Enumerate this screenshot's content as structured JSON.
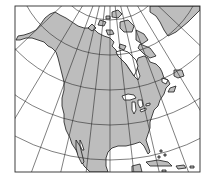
{
  "map": {
    "subject": "North America",
    "projection": "conic (graticule converging toward north pole)",
    "colors": {
      "land": "#bdbdbd",
      "ocean": "#ffffff",
      "graticule": "#2a2a2a",
      "coastline": "#1a1a1a",
      "frame": "#2a2a2a"
    },
    "frame": {
      "x": 15,
      "y": 6,
      "width": 185,
      "height": 166
    },
    "pole": {
      "x": 110,
      "y": -40
    },
    "parallels_radii": [
      60,
      95,
      130,
      165,
      200
    ],
    "meridian_angles_deg": [
      -60,
      -48,
      -36,
      -24,
      -12,
      0,
      12,
      24,
      36,
      48,
      60
    ],
    "features": [
      "Alaska",
      "Canada",
      "Greenland",
      "Canadian Arctic Archipelago",
      "Hudson Bay",
      "Great Lakes",
      "United States",
      "Mexico",
      "Baja California",
      "Florida",
      "Gulf of Mexico",
      "Cuba",
      "Caribbean islands",
      "Newfoundland"
    ]
  }
}
